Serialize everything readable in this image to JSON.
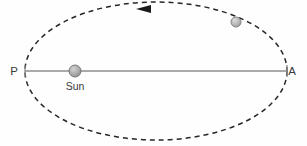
{
  "figure": {
    "kind": "orbit-diagram",
    "background_color": "#fefefe",
    "width": 307,
    "height": 146
  },
  "orbit": {
    "name": "orbit-ellipse",
    "style": "dashed",
    "color": "#262626",
    "stroke_width": 1.5,
    "dash_length": 5,
    "dash_gap": 4,
    "center_x": 156,
    "center_y": 71,
    "radius_x": 131,
    "radius_y": 69
  },
  "major_axis": {
    "name": "major-axis-line",
    "color": "#8c8c8c",
    "stroke_width": 1.4,
    "x_start": 25,
    "x_end": 287,
    "y": 71
  },
  "perihelion": {
    "label": "P",
    "label_x": 14,
    "label_y": 75,
    "tick_x": 25,
    "tick_y": 71,
    "tick_half_height": 6
  },
  "aphelion": {
    "label": "A",
    "label_x": 292,
    "label_y": 75,
    "tick_x": 287,
    "tick_y": 71,
    "tick_half_height": 6
  },
  "sun": {
    "label": "Sun",
    "center_x": 75,
    "center_y": 71,
    "radius": 6,
    "fill_color": "#a8a8a8",
    "edge_color": "#6e6e6e",
    "label_x": 75,
    "label_y": 90
  },
  "planet": {
    "label": "",
    "center_x": 236,
    "center_y": 22,
    "radius": 5,
    "fill_color": "#b4b4b4",
    "edge_color": "#7a7a7a"
  },
  "direction_arrow": {
    "name": "counterclockwise-direction-arrow",
    "tip_x": 136,
    "tip_y": 9,
    "tail_x": 151,
    "half_width": 4,
    "color": "#1a1a1a",
    "points": "136,9 151,5 151,13"
  }
}
